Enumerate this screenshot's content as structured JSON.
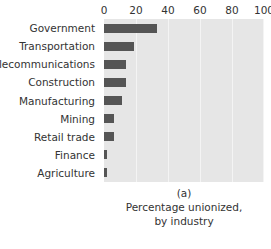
{
  "chart_data": {
    "type": "bar",
    "orientation": "horizontal",
    "title": "",
    "xlabel": "",
    "ylabel": "",
    "xlim": [
      0,
      100
    ],
    "ylim": null,
    "grid": true,
    "legend": null,
    "xticks": [
      0,
      20,
      40,
      60,
      80,
      100
    ],
    "xtick_labels": [
      "0",
      "20",
      "40",
      "60",
      "80",
      "100"
    ],
    "categories": [
      "Government",
      "Transportation",
      "Telecommunications",
      "Construction",
      "Manufacturing",
      "Mining",
      "Retail trade",
      "Finance",
      "Agriculture"
    ],
    "values": [
      33,
      19,
      14,
      14,
      11,
      6,
      6,
      2,
      2
    ],
    "colors": {
      "bar": "#555555",
      "plot_background": "#e6e6e6",
      "gridline": "#f4f4f4",
      "text": "#333333",
      "figure_background": "#ffffff"
    }
  },
  "caption": {
    "panel_label": "(a)",
    "line1": "Percentage unionized,",
    "line2": "by industry"
  }
}
